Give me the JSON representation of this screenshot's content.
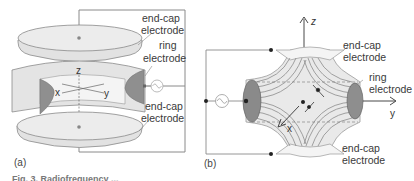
{
  "figure": {
    "panel_a": {
      "label": "(a)",
      "axes": {
        "x": "x",
        "y": "y",
        "z": "z"
      },
      "labels": {
        "top_endcap_1": "end-cap",
        "top_endcap_2": "electrode",
        "ring_1": "ring",
        "ring_2": "electrode",
        "bottom_endcap_1": "end-cap",
        "bottom_endcap_2": "electrode"
      },
      "source_icon": "ac-source-icon"
    },
    "panel_b": {
      "label": "(b)",
      "axes": {
        "x": "x",
        "y": "y",
        "z": "z"
      },
      "labels": {
        "top_endcap_1": "end-cap",
        "top_endcap_2": "electrode",
        "ring_1": "ring",
        "ring_2": "electrode",
        "bottom_endcap_1": "end-cap",
        "bottom_endcap_2": "electrode"
      },
      "source_icon": "ac-source-icon"
    },
    "caption_fragment": "Fig. 3. Radiofrequency ... "
  },
  "colors": {
    "electrode_fill": "#e6e6e6",
    "electrode_dark": "#8a8a8a",
    "line": "#7a7a7a",
    "field_line": "#8c8c8c"
  }
}
